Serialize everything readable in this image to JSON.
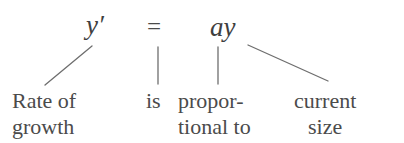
{
  "figure": {
    "kind": "annotated-equation",
    "background_color": "#ffffff",
    "text_color": "#4b4b4b",
    "line_color": "#6e6e6e",
    "equation": {
      "full": "y' = ay",
      "lhs": "y′",
      "operator": "=",
      "rhs": "ay"
    },
    "labels": [
      {
        "id": "rate-of-growth",
        "line1": "Rate of",
        "line2": "growth",
        "annotates": "lhs",
        "align": "left"
      },
      {
        "id": "is",
        "line1": "is",
        "line2": "",
        "annotates": "operator",
        "align": "left"
      },
      {
        "id": "proportional-to",
        "line1": "propor-",
        "line2": "tional to",
        "annotates": "coefficient-a",
        "align": "left"
      },
      {
        "id": "current-size",
        "line1": "current",
        "line2": "size",
        "annotates": "variable-y",
        "align": "center"
      }
    ],
    "connectors": [
      {
        "id": "connector-rate-of-growth",
        "type": "diagonal-up-right",
        "x1": 45,
        "y1": 85,
        "x2": 92,
        "y2": 46
      },
      {
        "id": "connector-is",
        "type": "vertical",
        "x1": 158,
        "y1": 47,
        "x2": 158,
        "y2": 84
      },
      {
        "id": "connector-proportional",
        "type": "vertical",
        "x1": 218,
        "y1": 47,
        "x2": 218,
        "y2": 84
      },
      {
        "id": "connector-current-size",
        "type": "diagonal-down-right",
        "x1": 248,
        "y1": 45,
        "x2": 328,
        "y2": 81
      }
    ]
  }
}
